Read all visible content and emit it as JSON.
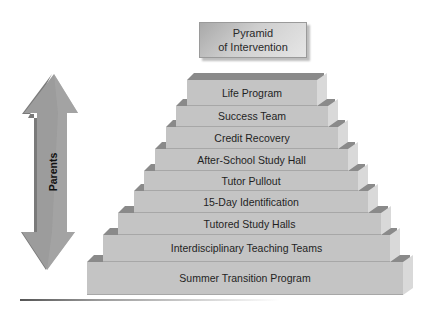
{
  "title": {
    "line1": "Pyramid",
    "line2": "of Intervention"
  },
  "side_arrow": {
    "label": "Parents",
    "direction": "bidirectional-vertical",
    "icon": "double-arrow-icon"
  },
  "pyramid": {
    "layers": [
      {
        "label": "Life Program",
        "left": 187,
        "top": 80,
        "width": 130,
        "height": 26
      },
      {
        "label": "Success Team",
        "left": 176,
        "top": 106,
        "width": 152,
        "height": 21
      },
      {
        "label": "Credit Recovery",
        "left": 166,
        "top": 127,
        "width": 172,
        "height": 22
      },
      {
        "label": "After-School Study Hall",
        "left": 155,
        "top": 149,
        "width": 193,
        "height": 22
      },
      {
        "label": "Tutor Pullout",
        "left": 144,
        "top": 171,
        "width": 214,
        "height": 20
      },
      {
        "label": "15-Day Identification",
        "left": 134,
        "top": 191,
        "width": 234,
        "height": 22
      },
      {
        "label": "Tutored Study Halls",
        "left": 118,
        "top": 213,
        "width": 263,
        "height": 22
      },
      {
        "label": "Interdisciplinary Teaching Teams",
        "left": 103,
        "top": 235,
        "width": 287,
        "height": 27
      },
      {
        "label": "Summer Transition Program",
        "left": 87,
        "top": 262,
        "width": 316,
        "height": 33
      }
    ]
  },
  "colors": {
    "layer_front": "#c4c4c4",
    "layer_top": "#8a8a8a",
    "layer_side": "#d9d9d9",
    "arrow": "#9a9a9a",
    "arrow_shade": "#7a7a7a"
  }
}
